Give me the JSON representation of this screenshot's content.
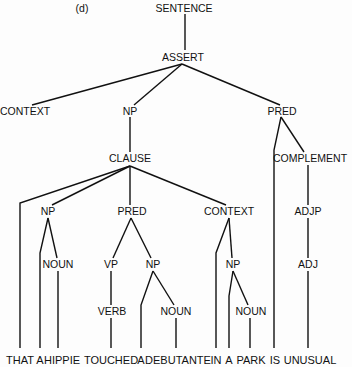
{
  "figure_label": "(d)",
  "nodes": {
    "sentence": "SENTENCE",
    "assert": "ASSERT",
    "context_top": "CONTEXT",
    "np_top": "NP",
    "pred_top": "PRED",
    "clause": "CLAUSE",
    "complement": "COMPLEMENT",
    "np_subj": "NP",
    "pred_clause": "PRED",
    "context_clause": "CONTEXT",
    "adjp": "ADJP",
    "noun_subj": "NOUN",
    "vp": "VP",
    "np_obj": "NP",
    "np_loc": "NP",
    "adj": "ADJ",
    "verb": "VERB",
    "noun_obj": "NOUN",
    "noun_loc": "NOUN"
  },
  "words": [
    "THAT",
    "A",
    "HIPPIE",
    "TOUCHED",
    "A",
    "DEBUTANTE",
    "IN",
    "A",
    "PARK",
    "IS",
    "UNUSUAL"
  ]
}
